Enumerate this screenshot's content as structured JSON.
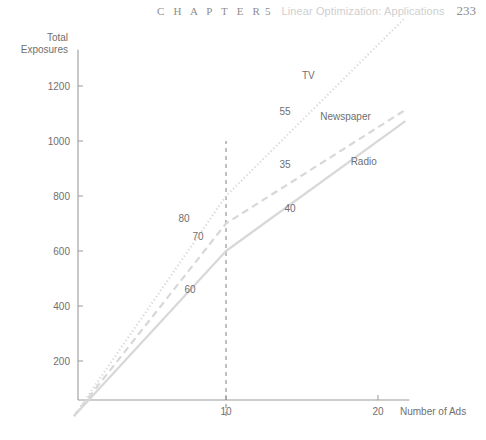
{
  "running_head": {
    "chapter_word": "C H A P T E R",
    "chapter_number": "5",
    "title": "Linear Optimization: Applications",
    "page_number": "233"
  },
  "chart_data": {
    "type": "line",
    "title": "",
    "xlabel": "Number of Ads",
    "ylabel": "Total Exposures",
    "ylabel_line1": "Total",
    "ylabel_line2": "Exposures",
    "xlim": [
      0,
      21.8
    ],
    "ylim": [
      0,
      1310
    ],
    "xticks": [
      "10",
      "20"
    ],
    "xtick_values": [
      10,
      20
    ],
    "yticks": [
      "200",
      "400",
      "600",
      "800",
      "1000",
      "1200"
    ],
    "ytick_values": [
      200,
      400,
      600,
      800,
      1000,
      1200
    ],
    "grid": "off",
    "legend_position": "inline-labels",
    "breakpoint_x": 10,
    "guide_line": {
      "type": "vertical-dashed",
      "x": 10,
      "y_from": 0,
      "y_to": 1000
    },
    "series": [
      {
        "name": "TV",
        "style": "dotted",
        "label": "TV",
        "label_x": 15,
        "label_y": 1225,
        "slope_before": 80,
        "slope_after": 55,
        "slope_label_before": "80",
        "slope_label_after": "55",
        "points": [
          [
            0,
            0
          ],
          [
            10,
            800
          ],
          [
            21.8,
            1449
          ]
        ]
      },
      {
        "name": "Newspaper",
        "style": "dashed",
        "label": "Newspaper",
        "label_x": 16.2,
        "label_y": 1075,
        "slope_before": 70,
        "slope_after": 35,
        "slope_label_before": "70",
        "slope_label_after": "35",
        "points": [
          [
            0,
            0
          ],
          [
            10,
            700
          ],
          [
            21.8,
            1113
          ]
        ]
      },
      {
        "name": "Radio",
        "style": "solid",
        "label": "Radio",
        "label_x": 18.2,
        "label_y": 913,
        "slope_before": 60,
        "slope_after": 40,
        "slope_label_before": "60",
        "slope_label_after": "40",
        "points": [
          [
            0,
            0
          ],
          [
            10,
            600
          ],
          [
            21.8,
            1072
          ]
        ]
      }
    ],
    "slope_annotations": [
      {
        "text": "80",
        "x_px": 184,
        "y_px": 222
      },
      {
        "text": "70",
        "x_px": 198,
        "y_px": 240
      },
      {
        "text": "60",
        "x_px": 190,
        "y_px": 293
      },
      {
        "text": "55",
        "x_px": 285,
        "y_px": 115
      },
      {
        "text": "35",
        "x_px": 285,
        "y_px": 168
      },
      {
        "text": "40",
        "x_px": 290,
        "y_px": 212
      }
    ],
    "colors": {
      "curve": "#d8d8d8",
      "axis": "#9b9b9b",
      "text": "#6f6f6f",
      "guide": "#8b8b8b",
      "head_accent": "#cfcfcf"
    }
  }
}
